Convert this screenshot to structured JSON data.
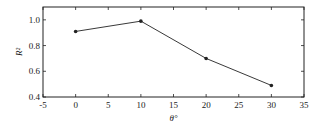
{
  "chart_data": {
    "type": "line",
    "title": "",
    "xlabel": "θ°",
    "ylabel": "R²",
    "x": [
      0,
      10,
      20,
      30
    ],
    "series": [
      {
        "name": "R²",
        "values": [
          0.91,
          0.99,
          0.7,
          0.49
        ],
        "marker": "filled-circle",
        "color": "#222222"
      }
    ],
    "xlim": [
      -5,
      35
    ],
    "ylim": [
      0.4,
      1.1
    ],
    "xticks": [
      "-5",
      "0",
      "5",
      "10",
      "15",
      "20",
      "25",
      "30",
      "35"
    ],
    "yticks": [
      "0.4",
      "0.6",
      "0.8",
      "1.0"
    ],
    "grid": false,
    "legend": "none"
  }
}
